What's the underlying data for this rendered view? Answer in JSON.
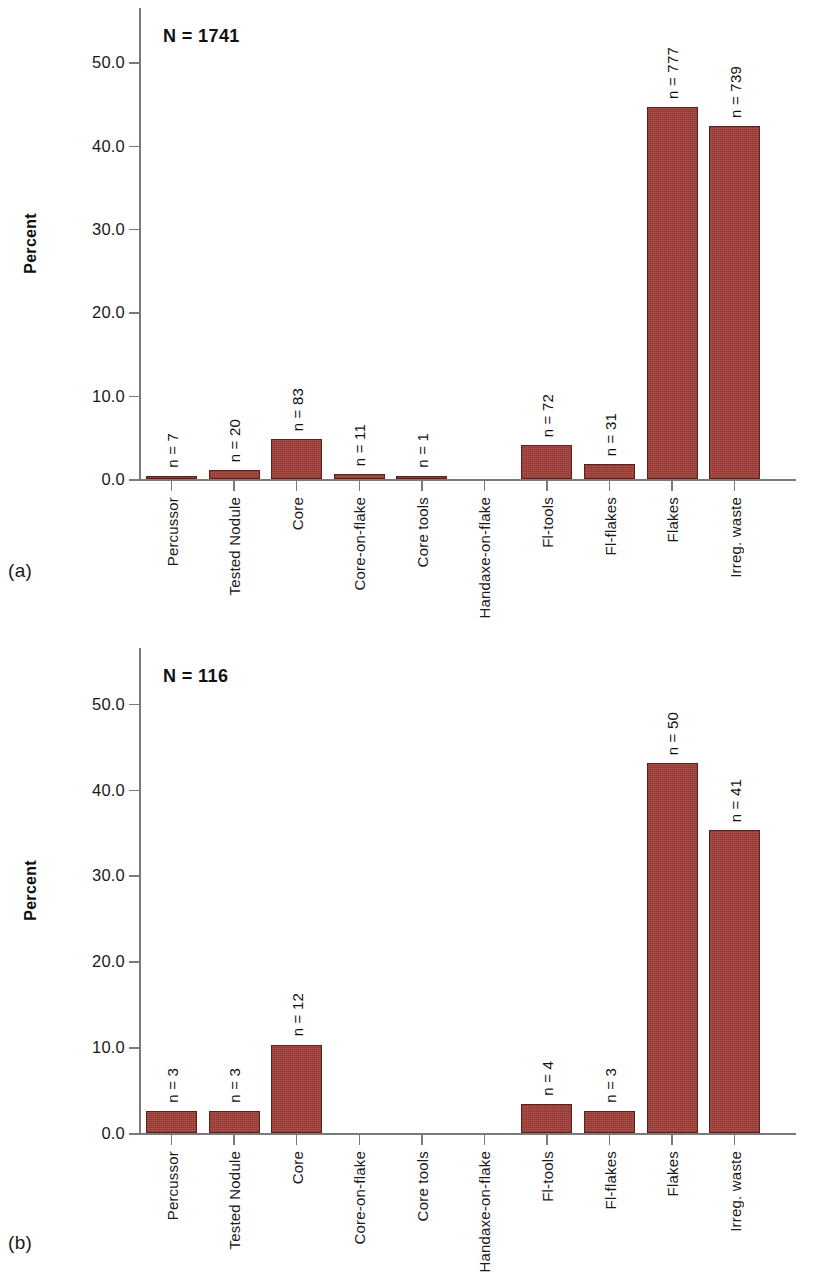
{
  "figure": {
    "panels": [
      {
        "letter": "(a)",
        "n_total_label": "N = 1741",
        "ylabel": "Percent"
      },
      {
        "letter": "(b)",
        "n_total_label": "N = 116",
        "ylabel": "Percent"
      }
    ],
    "colors": {
      "bar_fill": "#a8423a",
      "bar_stroke": "#5d211c",
      "axis": "#7a7a7a",
      "text": "#1a1a1a",
      "background": "#ffffff"
    }
  },
  "chart_data": [
    {
      "type": "bar",
      "title": "N = 1741",
      "panel": "(a)",
      "xlabel": "",
      "ylabel": "Percent",
      "ylim": [
        0,
        56.5
      ],
      "yticks": [
        0.0,
        10.0,
        20.0,
        30.0,
        40.0,
        50.0
      ],
      "ytick_labels": [
        "0.0",
        "10.0",
        "20.0",
        "30.0",
        "40.0",
        "50.0"
      ],
      "grid": false,
      "legend": false,
      "n_total": 1741,
      "categories": [
        "Percussor",
        "Tested Nodule",
        "Core",
        "Core-on-flake",
        "Core tools",
        "Handaxe-on-flake",
        "Fl-tools",
        "Fl-flakes",
        "Flakes",
        "Irreg. waste"
      ],
      "values": [
        0.4,
        1.1,
        4.8,
        0.6,
        0.1,
        0.0,
        4.1,
        1.8,
        44.6,
        42.4
      ],
      "counts": [
        7,
        20,
        83,
        11,
        1,
        0,
        72,
        31,
        777,
        739
      ],
      "point_labels": [
        "n = 7",
        "n = 20",
        "n = 83",
        "n = 11",
        "n = 1",
        "",
        "n = 72",
        "n = 31",
        "n = 777",
        "n = 739"
      ]
    },
    {
      "type": "bar",
      "title": "N = 116",
      "panel": "(b)",
      "xlabel": "",
      "ylabel": "Percent",
      "ylim": [
        0,
        56.5
      ],
      "yticks": [
        0.0,
        10.0,
        20.0,
        30.0,
        40.0,
        50.0
      ],
      "ytick_labels": [
        "0.0",
        "10.0",
        "20.0",
        "30.0",
        "40.0",
        "50.0"
      ],
      "grid": false,
      "legend": false,
      "n_total": 116,
      "categories": [
        "Percussor",
        "Tested Nodule",
        "Core",
        "Core-on-flake",
        "Core tools",
        "Handaxe-on-flake",
        "Fl-tools",
        "Fl-flakes",
        "Flakes",
        "Irreg. waste"
      ],
      "values": [
        2.6,
        2.6,
        10.3,
        0.0,
        0.0,
        0.0,
        3.4,
        2.6,
        43.1,
        35.3
      ],
      "counts": [
        3,
        3,
        12,
        0,
        0,
        0,
        4,
        3,
        50,
        41
      ],
      "point_labels": [
        "n = 3",
        "n = 3",
        "n = 12",
        "",
        "",
        "",
        "n = 4",
        "n = 3",
        "n = 50",
        "n = 41"
      ]
    }
  ]
}
